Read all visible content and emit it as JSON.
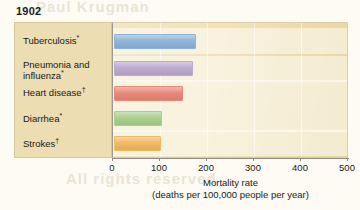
{
  "chart_data": {
    "type": "bar",
    "orientation": "horizontal",
    "title": "1902",
    "categories": [
      "Tuberculosis*",
      "Pneumonia and influenza*",
      "Heart disease†",
      "Diarrhea*",
      "Strokes†"
    ],
    "values": [
      175,
      168,
      147,
      103,
      99
    ],
    "xlabel": "Mortality rate",
    "xlabel_sub": "(deaths per 100,000 people per year)",
    "ylabel": "",
    "xlim": [
      0,
      500
    ],
    "xticks": [
      0,
      100,
      200,
      300,
      400,
      500
    ],
    "xtick_labels": [
      "0",
      "100",
      "200",
      "300",
      "400",
      "500"
    ],
    "grid": true,
    "legend": false,
    "bar_colors": [
      "#8fb4d6",
      "#bbaacd",
      "#e4897a",
      "#aace8d",
      "#efb966"
    ]
  },
  "chart": {
    "title": "1902",
    "rows": [
      {
        "label_line1": "Tuberculosis",
        "marker": "*",
        "label_line2": "",
        "marker2": "",
        "value": 175,
        "color": "#8fb4d6"
      },
      {
        "label_line1": "Pneumonia and",
        "marker": "",
        "label_line2": "influenza",
        "marker2": "*",
        "value": 168,
        "color": "#bbaacd"
      },
      {
        "label_line1": "Heart disease",
        "marker": "†",
        "label_line2": "",
        "marker2": "",
        "value": 147,
        "color": "#e4897a"
      },
      {
        "label_line1": "Diarrhea",
        "marker": "*",
        "label_line2": "",
        "marker2": "",
        "value": 103,
        "color": "#aace8d"
      },
      {
        "label_line1": "Strokes",
        "marker": "†",
        "label_line2": "",
        "marker2": "",
        "value": 99,
        "color": "#efb966"
      }
    ],
    "axis": {
      "title": "Mortality rate",
      "subtitle": "(deaths per 100,000 people per year)",
      "tick_labels": [
        "0",
        "100",
        "200",
        "300",
        "400",
        "500"
      ]
    },
    "watermark": {
      "line1": "Paul Krugman",
      "line2": "Economics",
      "line3": "Pearson Education",
      "line4": "All rights reserved"
    },
    "colors": {
      "label_panel_bg": "#ecddb2",
      "plot_bg": "#f0e3ba",
      "axis": "#8c8c84"
    }
  }
}
